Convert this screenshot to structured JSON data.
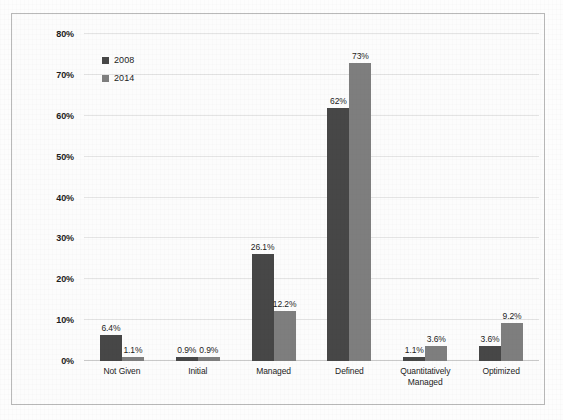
{
  "chart_data": {
    "type": "bar",
    "title": "",
    "subtitle": "",
    "xlabel": "",
    "ylabel": "",
    "categories": [
      "Not Given",
      "Initial",
      "Managed",
      "Defined",
      "Quantitatively\nManaged",
      "Optimized"
    ],
    "series": [
      {
        "name": "2008",
        "color": "#474747",
        "values": [
          6.4,
          0.9,
          26.1,
          62,
          1.1,
          3.6
        ],
        "labels": [
          "6.4%",
          "0.9%",
          "26.1%",
          "62%",
          "1.1%",
          "3.6%"
        ]
      },
      {
        "name": "2014",
        "color": "#7e7e7e",
        "values": [
          1.1,
          0.9,
          12.2,
          73,
          3.6,
          9.2
        ],
        "labels": [
          "1.1%",
          "0.9%",
          "12.2%",
          "73%",
          "3.6%",
          "9.2%"
        ]
      }
    ],
    "ylim": [
      0,
      80
    ],
    "ytick_step": 10,
    "ytick_labels": [
      "0%",
      "10%",
      "20%",
      "30%",
      "40%",
      "50%",
      "60%",
      "70%",
      "80%"
    ],
    "grid": true,
    "legend_position": "top-left",
    "value_labels_shown": true
  },
  "legend": {
    "items": [
      {
        "label": "2008",
        "color": "#474747"
      },
      {
        "label": "2014",
        "color": "#7e7e7e"
      }
    ]
  },
  "frame": {
    "border_color": "#b9b9b9",
    "background": "#fcfcfc"
  }
}
